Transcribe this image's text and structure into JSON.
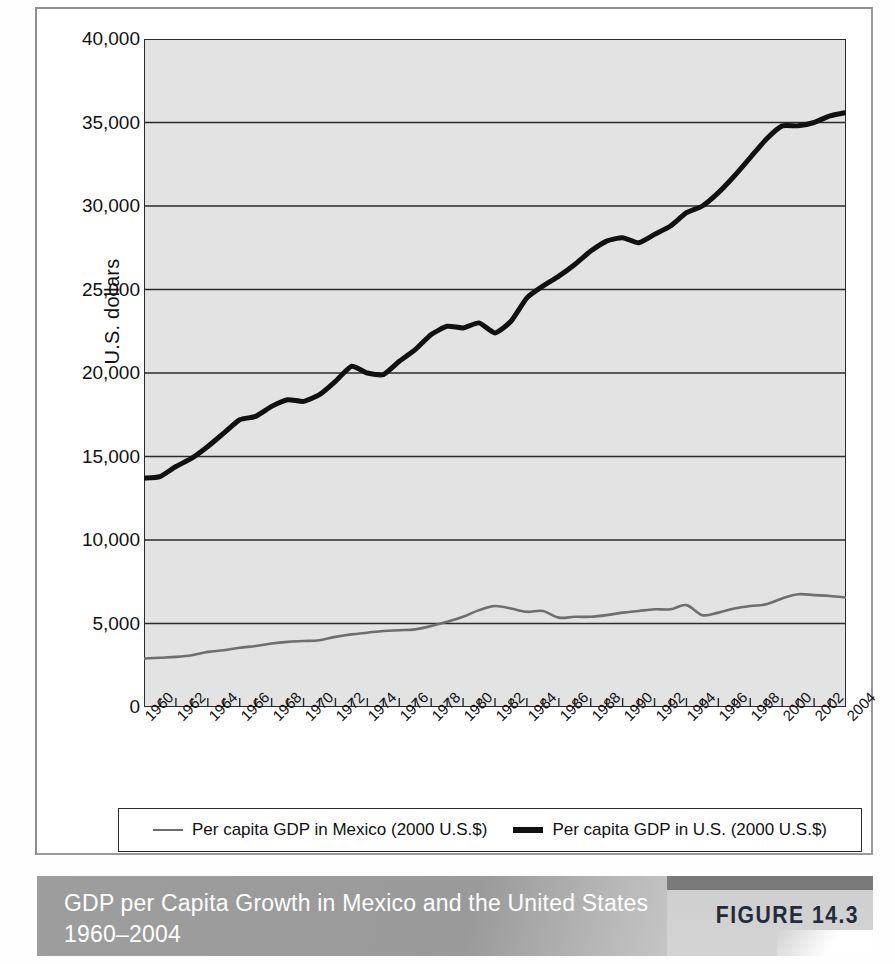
{
  "figure": {
    "caption": "GDP per Capita Growth in Mexico and the United States 1960–2004",
    "figure_number": "FIGURE 14.3"
  },
  "legend": {
    "items": [
      {
        "label": "Per capita GDP in Mexico (2000 U.S.$)",
        "color": "#6e6e6e",
        "style": "thin-gray-line"
      },
      {
        "label": "Per capita GDP in U.S. (2000 U.S.$)",
        "color": "#111111",
        "style": "thick-black-line"
      }
    ]
  },
  "chart_data": {
    "type": "line",
    "title": "GDP per Capita Growth in Mexico and the United States 1960–2004",
    "xlabel": "",
    "ylabel": "U.S. dollars",
    "xlim": [
      1960,
      2004
    ],
    "ylim": [
      0,
      40000
    ],
    "grid": "horizontal",
    "legend_position": "below-axes",
    "ytick_labels": [
      "0",
      "5,000",
      "10,000",
      "15,000",
      "20,000",
      "25,000",
      "30,000",
      "35,000",
      "40,000"
    ],
    "ytick_values": [
      0,
      5000,
      10000,
      15000,
      20000,
      25000,
      30000,
      35000,
      40000
    ],
    "xtick_labels": [
      "1960",
      "1962",
      "1964",
      "1966",
      "1968",
      "1970",
      "1972",
      "1974",
      "1976",
      "1978",
      "1980",
      "1982",
      "1984",
      "1986",
      "1988",
      "1990",
      "1992",
      "1994",
      "1996",
      "1998",
      "2000",
      "2002",
      "2004"
    ],
    "x": [
      1960,
      1961,
      1962,
      1963,
      1964,
      1965,
      1966,
      1967,
      1968,
      1969,
      1970,
      1971,
      1972,
      1973,
      1974,
      1975,
      1976,
      1977,
      1978,
      1979,
      1980,
      1981,
      1982,
      1983,
      1984,
      1985,
      1986,
      1987,
      1988,
      1989,
      1990,
      1991,
      1992,
      1993,
      1994,
      1995,
      1996,
      1997,
      1998,
      1999,
      2000,
      2001,
      2002,
      2003,
      2004
    ],
    "series": [
      {
        "name": "Per capita GDP in U.S. (2000 U.S.$)",
        "color": "#111111",
        "width": 5,
        "values": [
          13700,
          13800,
          14400,
          14900,
          15600,
          16400,
          17200,
          17400,
          18000,
          18400,
          18300,
          18700,
          19500,
          20400,
          20000,
          19900,
          20700,
          21400,
          22300,
          22800,
          22700,
          23000,
          22400,
          23100,
          24500,
          25200,
          25800,
          26500,
          27300,
          27900,
          28100,
          27800,
          28300,
          28800,
          29600,
          30000,
          30800,
          31800,
          32900,
          34000,
          34800,
          34800,
          35000,
          35400,
          35600
        ]
      },
      {
        "name": "Per capita GDP in Mexico (2000 U.S.$)",
        "color": "#6e6e6e",
        "width": 2.6,
        "values": [
          2900,
          2950,
          3000,
          3100,
          3300,
          3400,
          3550,
          3650,
          3800,
          3900,
          3950,
          4000,
          4200,
          4350,
          4450,
          4550,
          4600,
          4650,
          4850,
          5100,
          5400,
          5800,
          6050,
          5900,
          5700,
          5750,
          5350,
          5400,
          5400,
          5500,
          5650,
          5750,
          5850,
          5850,
          6100,
          5500,
          5650,
          5900,
          6050,
          6150,
          6500,
          6750,
          6700,
          6650,
          6550
        ]
      }
    ]
  }
}
